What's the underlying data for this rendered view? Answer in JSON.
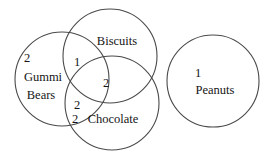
{
  "diagram": {
    "type": "venn-diagram",
    "title": "",
    "background_color": "#ffffff",
    "stroke_color": "#4a4a4a",
    "text_color": "#151515",
    "sets": [
      {
        "id": "gummi-bears",
        "label": "Gummi Bears",
        "label_line_1": "Gummi",
        "label_line_2": "Bears",
        "exclusive_count": "2",
        "center_x": 62,
        "center_y": 79,
        "radius": 47
      },
      {
        "id": "biscuits",
        "label": "Biscuits",
        "exclusive_count": "",
        "center_x": 110,
        "center_y": 56,
        "radius": 47
      },
      {
        "id": "chocolate",
        "label": "Chocolate",
        "exclusive_count": "2",
        "center_x": 112,
        "center_y": 103,
        "radius": 47
      },
      {
        "id": "peanuts",
        "label": "Peanuts",
        "exclusive_count": "1",
        "center_x": 213,
        "center_y": 81,
        "radius": 46
      }
    ],
    "regions": [
      {
        "id": "gummi-only",
        "sets": [
          "gummi-bears"
        ],
        "count": "2",
        "x": 27,
        "y": 58
      },
      {
        "id": "gummi-biscuits",
        "sets": [
          "gummi-bears",
          "biscuits"
        ],
        "count": "1",
        "x": 76,
        "y": 62
      },
      {
        "id": "biscuits-chocolate",
        "sets": [
          "biscuits",
          "chocolate"
        ],
        "count": "2",
        "x": 106,
        "y": 83
      },
      {
        "id": "gummi-chocolate",
        "sets": [
          "gummi-bears",
          "chocolate"
        ],
        "count": "2",
        "x": 76,
        "y": 105
      },
      {
        "id": "chocolate-only",
        "sets": [
          "chocolate"
        ],
        "count": "2",
        "x": 74,
        "y": 119
      },
      {
        "id": "peanuts-only",
        "sets": [
          "peanuts"
        ],
        "count": "1",
        "x": 198,
        "y": 73
      }
    ],
    "labels": {
      "biscuits_label": "Biscuits",
      "chocolate_label": "Chocolate",
      "gummi_label_line_1": "Gummi",
      "gummi_label_line_2": "Bears",
      "peanuts_label": "Peanuts",
      "gummi_count": "2",
      "gummi_biscuits_count": "1",
      "biscuits_chocolate_count": "2",
      "gummi_chocolate_count": "2",
      "chocolate_count": "2",
      "peanuts_count": "1"
    }
  }
}
